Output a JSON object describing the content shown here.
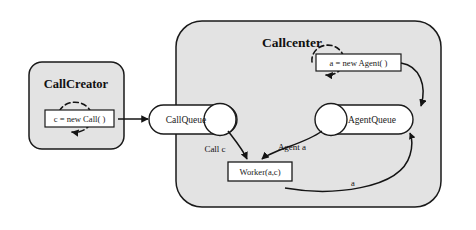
{
  "diagram": {
    "type": "uml-object-collaboration-diagram",
    "background_color": "#ffffff",
    "node_fill_color": "#e3e3e3",
    "shape_fill_color": "#ffffff",
    "stroke_color": "#1a1a1a"
  },
  "components": {
    "call_creator": {
      "title": "CallCreator",
      "statement": "c = new Call( )",
      "has_dashed_self_loop": true
    },
    "callcenter": {
      "title": "Callcenter",
      "statement": "a = new Agent( )",
      "has_dashed_self_loop": true
    }
  },
  "queues": {
    "call_queue": "CallQueue",
    "agent_queue": "AgentQueue"
  },
  "worker": {
    "label": "Worker(a,c)"
  },
  "edge_labels": {
    "call_c": "Call c",
    "agent_a": "Agent a",
    "a_return": "a"
  }
}
